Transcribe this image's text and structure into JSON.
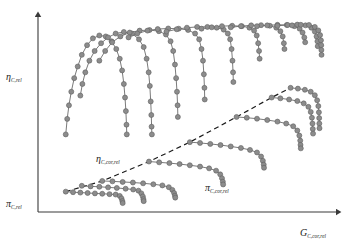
{
  "figure": {
    "kind": "compressor-map-schematic",
    "background": "#ffffff",
    "marker_fill": "#8c8c8c",
    "marker_stroke": "#5f5f5f",
    "curve_color": "#6b6b6b",
    "axis_color": "#3a3a3a",
    "surge_line_color": "#1a1a1a",
    "surge_line_style": "dashed"
  },
  "labels": {
    "y_axis_upper": {
      "base": "η",
      "sub": "C,rel"
    },
    "y_axis_lower": {
      "base": "π",
      "sub": "C,rel"
    },
    "x_axis": {
      "base": "G",
      "sub": "C,cor,rel"
    },
    "inner_efficiency": {
      "base": "η",
      "sub": "C,cor,rel"
    },
    "inner_pressure": {
      "base": "π",
      "sub": "C,cor,rel"
    }
  },
  "chart_data": {
    "type": "scatter",
    "title": "",
    "xlabel": "G_C,cor,rel",
    "ylabel": "η_C,rel  /  π_C,rel",
    "xlim": [
      0,
      100
    ],
    "ylim": [
      0,
      100
    ],
    "grid": false,
    "legend": "none",
    "annotations": [
      {
        "text": "η_C,cor,rel",
        "x": 20,
        "y": 33
      },
      {
        "text": "π_C,cor,rel",
        "x": 55,
        "y": 20
      }
    ],
    "surge_line": {
      "name": "surge-line",
      "style": "dashed",
      "points": [
        [
          9.5,
          10.5
        ],
        [
          22,
          16
        ],
        [
          38,
          26
        ],
        [
          52,
          36
        ],
        [
          68,
          49
        ],
        [
          80,
          59
        ],
        [
          86.5,
          64
        ]
      ]
    },
    "series": [
      {
        "name": "efficiency-speedline-1",
        "group": "efficiency",
        "points": [
          [
            9.5,
            40
          ],
          [
            10,
            48
          ],
          [
            10.6,
            55
          ],
          [
            11.4,
            62
          ],
          [
            12.4,
            69
          ],
          [
            13.6,
            75
          ],
          [
            15,
            81
          ],
          [
            16.8,
            86
          ],
          [
            18.8,
            89.5
          ],
          [
            21,
            91
          ],
          [
            23.2,
            90.5
          ],
          [
            25.2,
            88
          ],
          [
            26.8,
            84
          ],
          [
            28,
            79
          ],
          [
            28.8,
            73
          ],
          [
            29.4,
            66
          ],
          [
            29.8,
            59
          ],
          [
            30.1,
            52
          ],
          [
            30.3,
            45
          ],
          [
            30.4,
            40
          ]
        ]
      },
      {
        "name": "efficiency-speedline-2",
        "group": "efficiency",
        "points": [
          [
            14.5,
            60
          ],
          [
            15.2,
            66
          ],
          [
            16.2,
            72
          ],
          [
            17.6,
            78
          ],
          [
            19.4,
            83
          ],
          [
            21.6,
            87
          ],
          [
            24,
            90
          ],
          [
            26.6,
            92
          ],
          [
            29.4,
            92.8
          ],
          [
            32.2,
            92
          ],
          [
            34.6,
            89
          ],
          [
            36.2,
            85
          ],
          [
            37.2,
            79
          ],
          [
            37.9,
            72
          ],
          [
            38.3,
            65
          ],
          [
            38.6,
            57
          ],
          [
            38.8,
            50
          ],
          [
            38.9,
            44
          ],
          [
            39,
            40
          ]
        ]
      },
      {
        "name": "efficiency-speedline-3",
        "group": "efficiency",
        "points": [
          [
            21,
            78
          ],
          [
            23,
            83
          ],
          [
            25.4,
            87.5
          ],
          [
            28.2,
            90.5
          ],
          [
            31.4,
            92.5
          ],
          [
            34.8,
            93.5
          ],
          [
            38.2,
            93.8
          ],
          [
            41.4,
            93.2
          ],
          [
            43.8,
            91.5
          ],
          [
            45.4,
            88
          ],
          [
            46.3,
            83
          ],
          [
            46.9,
            76
          ],
          [
            47.3,
            69
          ],
          [
            47.6,
            62
          ],
          [
            47.8,
            55
          ],
          [
            47.9,
            49
          ]
        ]
      },
      {
        "name": "efficiency-speedline-4",
        "group": "efficiency",
        "points": [
          [
            31,
            90
          ],
          [
            34,
            92
          ],
          [
            37.5,
            93.5
          ],
          [
            41,
            94.3
          ],
          [
            44.6,
            94.6
          ],
          [
            48.2,
            94.5
          ],
          [
            51.4,
            93.8
          ],
          [
            53.8,
            92
          ],
          [
            55.2,
            89
          ],
          [
            56,
            84
          ],
          [
            56.5,
            78
          ],
          [
            56.8,
            71
          ],
          [
            57,
            64
          ],
          [
            57.1,
            58
          ]
        ]
      },
      {
        "name": "efficiency-speedline-5",
        "group": "efficiency",
        "points": [
          [
            44,
            93
          ],
          [
            47.5,
            94.2
          ],
          [
            51,
            95
          ],
          [
            54.5,
            95.4
          ],
          [
            58,
            95.4
          ],
          [
            61.2,
            95
          ],
          [
            63.6,
            94
          ],
          [
            65,
            92
          ],
          [
            65.8,
            89
          ],
          [
            66.3,
            84
          ],
          [
            66.6,
            78
          ],
          [
            66.8,
            72
          ],
          [
            66.9,
            67
          ]
        ]
      },
      {
        "name": "efficiency-speedline-6",
        "group": "efficiency",
        "points": [
          [
            56,
            94.5
          ],
          [
            59.5,
            95.2
          ],
          [
            63,
            95.8
          ],
          [
            66.5,
            96
          ],
          [
            69.8,
            95.8
          ],
          [
            72.4,
            95
          ],
          [
            74,
            93.5
          ],
          [
            74.9,
            91
          ],
          [
            75.4,
            87
          ],
          [
            75.7,
            83
          ],
          [
            75.9,
            79
          ]
        ]
      },
      {
        "name": "efficiency-speedline-7",
        "group": "efficiency",
        "points": [
          [
            66,
            95.2
          ],
          [
            69.5,
            95.8
          ],
          [
            73,
            96.2
          ],
          [
            76.4,
            96.3
          ],
          [
            79.4,
            96
          ],
          [
            81.6,
            95
          ],
          [
            83,
            93.2
          ],
          [
            83.8,
            90.5
          ],
          [
            84.2,
            87
          ],
          [
            84.4,
            84
          ]
        ]
      },
      {
        "name": "efficiency-speedline-8",
        "group": "efficiency",
        "points": [
          [
            75,
            95.8
          ],
          [
            78.5,
            96.2
          ],
          [
            82,
            96.5
          ],
          [
            85.2,
            96.4
          ],
          [
            87.8,
            95.8
          ],
          [
            89.6,
            94.5
          ],
          [
            90.6,
            92.5
          ],
          [
            91.2,
            90
          ],
          [
            91.5,
            87.5
          ]
        ]
      },
      {
        "name": "efficiency-speedline-9",
        "group": "efficiency",
        "points": [
          [
            82,
            96
          ],
          [
            85.5,
            96.4
          ],
          [
            88.8,
            96.6
          ],
          [
            91.6,
            96.2
          ],
          [
            93.6,
            95
          ],
          [
            94.8,
            93
          ],
          [
            95.4,
            90.5
          ],
          [
            95.7,
            88
          ],
          [
            95.8,
            85.5
          ]
        ]
      },
      {
        "name": "efficiency-speedline-10",
        "group": "efficiency",
        "points": [
          [
            87,
            96.2
          ],
          [
            90,
            96.5
          ],
          [
            92.8,
            96.4
          ],
          [
            94.8,
            95.4
          ],
          [
            96,
            93.6
          ],
          [
            96.6,
            91.2
          ],
          [
            96.9,
            88.5
          ],
          [
            97,
            86
          ],
          [
            97.05,
            83.5
          ],
          [
            97.1,
            81
          ]
        ]
      },
      {
        "name": "pressure-speedline-1",
        "group": "pressure",
        "points": [
          [
            9.5,
            10.5
          ],
          [
            12,
            10.2
          ],
          [
            14.5,
            10
          ],
          [
            17,
            9.8
          ],
          [
            19.5,
            9.6
          ],
          [
            22,
            9.4
          ],
          [
            24.5,
            9.2
          ],
          [
            26.6,
            9
          ],
          [
            28,
            8.3
          ],
          [
            28.6,
            7
          ],
          [
            28.9,
            5.6
          ],
          [
            29,
            4.6
          ]
        ]
      },
      {
        "name": "pressure-speedline-2",
        "group": "pressure",
        "points": [
          [
            15,
            13.5
          ],
          [
            18,
            13.2
          ],
          [
            21,
            13
          ],
          [
            24,
            12.7
          ],
          [
            27,
            12.4
          ],
          [
            30,
            12
          ],
          [
            32.6,
            11.6
          ],
          [
            34.4,
            11
          ],
          [
            35.4,
            9.6
          ],
          [
            35.9,
            8
          ],
          [
            36.1,
            6.6
          ],
          [
            36.2,
            5.6
          ]
        ]
      },
      {
        "name": "pressure-speedline-3",
        "group": "pressure",
        "points": [
          [
            22,
            16
          ],
          [
            25.5,
            15.8
          ],
          [
            29,
            15.5
          ],
          [
            32.5,
            15.2
          ],
          [
            36,
            14.8
          ],
          [
            39.5,
            14.3
          ],
          [
            42.6,
            13.7
          ],
          [
            44.8,
            12.8
          ],
          [
            46,
            11.4
          ],
          [
            46.6,
            9.8
          ],
          [
            46.9,
            8.4
          ],
          [
            47,
            7.4
          ]
        ]
      },
      {
        "name": "pressure-speedline-4",
        "group": "pressure",
        "points": [
          [
            38,
            26
          ],
          [
            41.5,
            25.6
          ],
          [
            45,
            25.2
          ],
          [
            48.5,
            24.7
          ],
          [
            52,
            24.1
          ],
          [
            55.5,
            23.4
          ],
          [
            58.6,
            22.5
          ],
          [
            61,
            21.3
          ],
          [
            62.4,
            19.4
          ],
          [
            63,
            17.4
          ],
          [
            63.3,
            15.6
          ],
          [
            63.4,
            14.2
          ]
        ]
      },
      {
        "name": "pressure-speedline-5",
        "group": "pressure",
        "points": [
          [
            52,
            36
          ],
          [
            55.5,
            35.6
          ],
          [
            59,
            35.1
          ],
          [
            62.5,
            34.5
          ],
          [
            66,
            33.8
          ],
          [
            69.5,
            33
          ],
          [
            72.6,
            32
          ],
          [
            75,
            30.7
          ],
          [
            76.4,
            28.6
          ],
          [
            77,
            26.4
          ],
          [
            77.3,
            24.4
          ],
          [
            77.4,
            22.8
          ]
        ]
      },
      {
        "name": "pressure-speedline-6",
        "group": "pressure",
        "points": [
          [
            68,
            49
          ],
          [
            71.5,
            48.6
          ],
          [
            75,
            48.1
          ],
          [
            78.5,
            47.4
          ],
          [
            82,
            46.6
          ],
          [
            85,
            45.6
          ],
          [
            87.4,
            44.2
          ],
          [
            88.8,
            42
          ],
          [
            89.5,
            39.4
          ],
          [
            89.8,
            36.8
          ],
          [
            89.9,
            34.6
          ],
          [
            90,
            32.8
          ]
        ]
      },
      {
        "name": "pressure-speedline-7",
        "group": "pressure",
        "points": [
          [
            80,
            59
          ],
          [
            83,
            58.6
          ],
          [
            86,
            58
          ],
          [
            88.8,
            57.2
          ],
          [
            91,
            56
          ],
          [
            92.6,
            54.2
          ],
          [
            93.4,
            51.6
          ],
          [
            93.8,
            48.6
          ],
          [
            94,
            45.6
          ],
          [
            94.1,
            42.8
          ],
          [
            94.2,
            40.4
          ]
        ]
      },
      {
        "name": "pressure-speedline-8",
        "group": "pressure",
        "points": [
          [
            86.5,
            64
          ],
          [
            89,
            63.6
          ],
          [
            91.4,
            63
          ],
          [
            93.4,
            62
          ],
          [
            94.8,
            60.2
          ],
          [
            95.6,
            57.6
          ],
          [
            96,
            54.6
          ],
          [
            96.2,
            51.4
          ],
          [
            96.3,
            48.4
          ],
          [
            96.35,
            45.6
          ],
          [
            96.4,
            43.2
          ]
        ]
      }
    ]
  }
}
